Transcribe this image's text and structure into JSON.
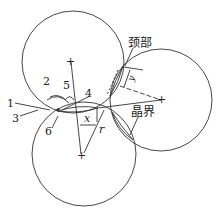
{
  "diagram": {
    "labels": {
      "neck": "颈部",
      "grain_boundary": "晶界",
      "n1": "1",
      "n2": "2",
      "n3": "3",
      "n4": "4",
      "n5": "5",
      "n6": "6",
      "x": "x",
      "r": "r",
      "y": "y"
    },
    "center_mark": "+",
    "circles": [
      {
        "name": "top-particle",
        "cx": 73,
        "cy": 62,
        "r": 51
      },
      {
        "name": "bottom-particle",
        "cx": 84,
        "cy": 154,
        "r": 52
      },
      {
        "name": "right-particle",
        "cx": 161,
        "cy": 100,
        "r": 51
      }
    ]
  }
}
